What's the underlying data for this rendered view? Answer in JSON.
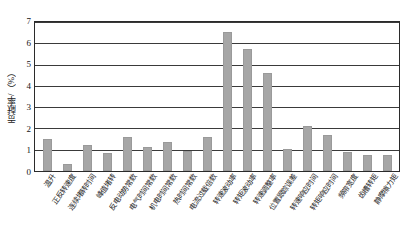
{
  "chart_data": {
    "type": "bar",
    "title": "",
    "xlabel": "",
    "ylabel": "贡献率/（%）",
    "ylim": [
      0,
      7
    ],
    "yticks": [
      0,
      1,
      2,
      3,
      4,
      5,
      6,
      7
    ],
    "grid": true,
    "legend": false,
    "bar_color": "#a6a6a6",
    "axis_color": "#2b2b2b",
    "categories": [
      "温升",
      "正反转速度",
      "连续堵转时间",
      "峰值堵转",
      "反电动势常数",
      "电气时间常数",
      "机电时间常数",
      "热时间常数",
      "电流过载倍数",
      "转速波动率",
      "转矩波动率",
      "转速调整率",
      "位置跟踪误差",
      "转速响应时间",
      "转矩响应时间",
      "频带宽度",
      "齿槽转矩",
      "静摩擦力矩"
    ],
    "values": [
      1.5,
      0.35,
      1.2,
      0.85,
      1.6,
      1.15,
      1.35,
      0.95,
      1.6,
      6.55,
      5.75,
      4.6,
      1.05,
      2.1,
      1.7,
      0.9,
      0.75,
      0.75
    ]
  }
}
